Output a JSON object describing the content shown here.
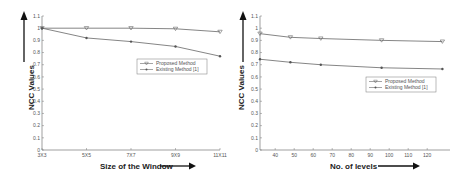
{
  "chart_data": [
    {
      "type": "line",
      "title": "",
      "xlabel": "Size of the Window",
      "ylabel": "NCC Values",
      "categories": [
        "3X3",
        "5X5",
        "7X7",
        "9X9",
        "11X11"
      ],
      "series": [
        {
          "name": "Proposed Method",
          "marker": "triangle-down",
          "values": [
            1.0,
            1.0,
            1.0,
            0.995,
            0.97
          ]
        },
        {
          "name": "Existing Method [1]",
          "marker": "star",
          "values": [
            1.0,
            0.92,
            0.89,
            0.85,
            0.77
          ]
        }
      ],
      "ylim": [
        0,
        1.1
      ],
      "yticks": [
        "0",
        "0.1",
        "0.2",
        "0.3",
        "0.4",
        "0.5",
        "0.6",
        "0.7",
        "0.8",
        "0.9",
        "1",
        "1.1"
      ],
      "grid": false,
      "legend_position": "center-right"
    },
    {
      "type": "line",
      "title": "",
      "xlabel": "No. of levels",
      "ylabel": "NCC Values",
      "x": [
        32,
        48,
        64,
        96,
        128
      ],
      "series": [
        {
          "name": "Proposed Method",
          "marker": "triangle-down",
          "values": [
            0.955,
            0.925,
            0.915,
            0.9,
            0.89
          ]
        },
        {
          "name": "Existing Method [1]",
          "marker": "star",
          "values": [
            0.745,
            0.72,
            0.7,
            0.675,
            0.665
          ]
        }
      ],
      "xlim": [
        32,
        132
      ],
      "xticks": [
        "40",
        "50",
        "60",
        "70",
        "80",
        "90",
        "100",
        "110",
        "120"
      ],
      "ylim": [
        0,
        1.1
      ],
      "yticks": [
        "0",
        "0.1",
        "0.2",
        "0.3",
        "0.4",
        "0.5",
        "0.6",
        "0.7",
        "0.8",
        "0.9",
        "1",
        "1.1"
      ],
      "grid": false,
      "legend_position": "center-right"
    }
  ]
}
